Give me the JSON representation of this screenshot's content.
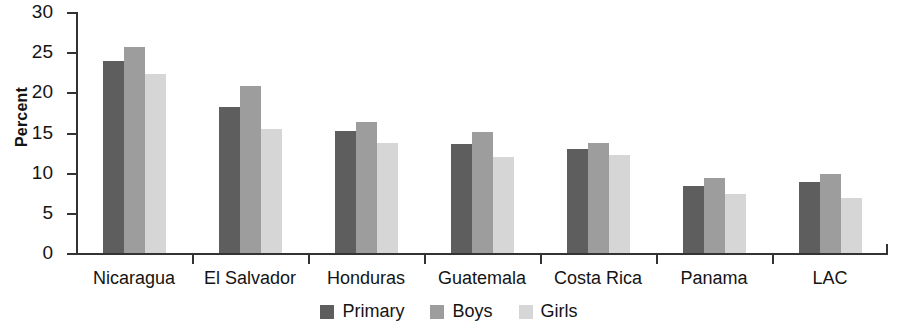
{
  "chart_data": {
    "type": "bar",
    "title": "",
    "xlabel": "",
    "ylabel": "Percent",
    "ylim": [
      0,
      30
    ],
    "yticks": [
      0,
      5,
      10,
      15,
      20,
      25,
      30
    ],
    "grid": false,
    "legend_position": "bottom-center",
    "categories": [
      "Nicaragua",
      "El Salvador",
      "Honduras",
      "Guatemala",
      "Costa Rica",
      "Panama",
      "LAC"
    ],
    "series": [
      {
        "name": "Primary",
        "color": "#5e5e5e",
        "values": [
          23.9,
          18.2,
          15.2,
          13.6,
          12.9,
          8.4,
          8.8
        ]
      },
      {
        "name": "Boys",
        "color": "#9d9d9d",
        "values": [
          25.7,
          20.8,
          16.3,
          15.1,
          13.7,
          9.4,
          9.8
        ]
      },
      {
        "name": "Girls",
        "color": "#d6d6d6",
        "values": [
          22.3,
          15.4,
          13.7,
          12.0,
          12.2,
          7.4,
          6.8
        ]
      }
    ]
  },
  "axis": {
    "y_label": "Percent",
    "y_tick_labels": [
      "30",
      "25",
      "20",
      "15",
      "10",
      "5",
      "0"
    ]
  },
  "legend": {
    "items": [
      {
        "label": "Primary",
        "color": "#5e5e5e"
      },
      {
        "label": "Boys",
        "color": "#9d9d9d"
      },
      {
        "label": "Girls",
        "color": "#d6d6d6"
      }
    ]
  }
}
